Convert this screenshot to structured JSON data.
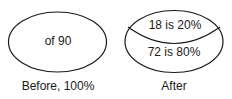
{
  "diagram": {
    "before": {
      "center_text": "of 90",
      "caption": "Before, 100%"
    },
    "after": {
      "top_text": "18 is 20%",
      "bottom_text": "72 is 80%",
      "caption": "After"
    },
    "stroke_color": "#1a1a1a"
  }
}
